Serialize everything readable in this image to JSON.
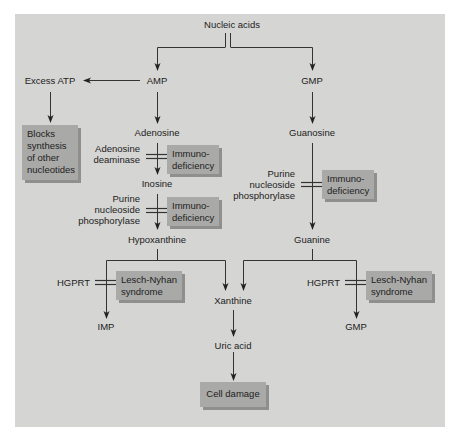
{
  "diagram": {
    "nodes": {
      "nucleic_acids": "Nucleic acids",
      "amp": "AMP",
      "gmp_top": "GMP",
      "excess_atp": "Excess ATP",
      "adenosine": "Adenosine",
      "guanosine": "Guanosine",
      "inosine": "Inosine",
      "hypoxanthine": "Hypoxanthine",
      "guanine": "Guanine",
      "xanthine": "Xanthine",
      "uric_acid": "Uric acid",
      "imp": "IMP",
      "gmp_bottom": "GMP"
    },
    "enzymes": {
      "adenosine_deaminase_1": "Adenosine",
      "adenosine_deaminase_2": "deaminase",
      "pnp_left_1": "Purine",
      "pnp_left_2": "nucleoside",
      "pnp_left_3": "phosphorylase",
      "pnp_right_1": "Purine",
      "pnp_right_2": "nucleoside",
      "pnp_right_3": "phosphorylase",
      "hgprt_left": "HGPRT",
      "hgprt_right": "HGPRT"
    },
    "boxes": {
      "blocks_1": "Blocks",
      "blocks_2": "synthesis",
      "blocks_3": "of other",
      "blocks_4": "nucleotides",
      "immuno_a_1": "Immuno-",
      "immuno_a_2": "deficiency",
      "immuno_b_1": "Immuno-",
      "immuno_b_2": "deficiency",
      "immuno_c_1": "Immuno-",
      "immuno_c_2": "deficiency",
      "lesch_left_1": "Lesch-Nyhan",
      "lesch_left_2": "syndrome",
      "lesch_right_1": "Lesch-Nyhan",
      "lesch_right_2": "syndrome",
      "cell_damage": "Cell damage"
    },
    "colors": {
      "panel_bg": "#d5d5d3",
      "box_bg": "#a9a9a7",
      "box_shadow": "#8f8f8d",
      "line": "#333333"
    }
  }
}
